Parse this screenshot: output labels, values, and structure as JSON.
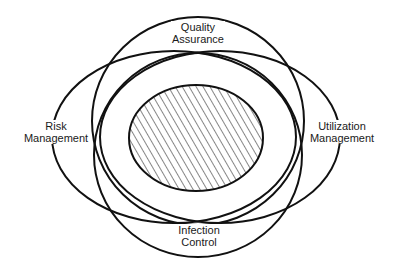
{
  "diagram": {
    "type": "venn",
    "sets": [
      {
        "id": "qa",
        "lines": [
          "Quality",
          "Assurance"
        ],
        "position": "top"
      },
      {
        "id": "rm",
        "lines": [
          "Risk",
          "Management"
        ],
        "position": "left"
      },
      {
        "id": "um",
        "lines": [
          "Utilization",
          "Management"
        ],
        "position": "right"
      },
      {
        "id": "ic",
        "lines": [
          "Infection",
          "Control"
        ],
        "position": "bottom"
      }
    ],
    "center": {
      "fill": "hatched",
      "description": "overlap of all four areas"
    },
    "colors": {
      "stroke": "#111111",
      "background": "#ffffff",
      "hatch": "#222222"
    }
  }
}
